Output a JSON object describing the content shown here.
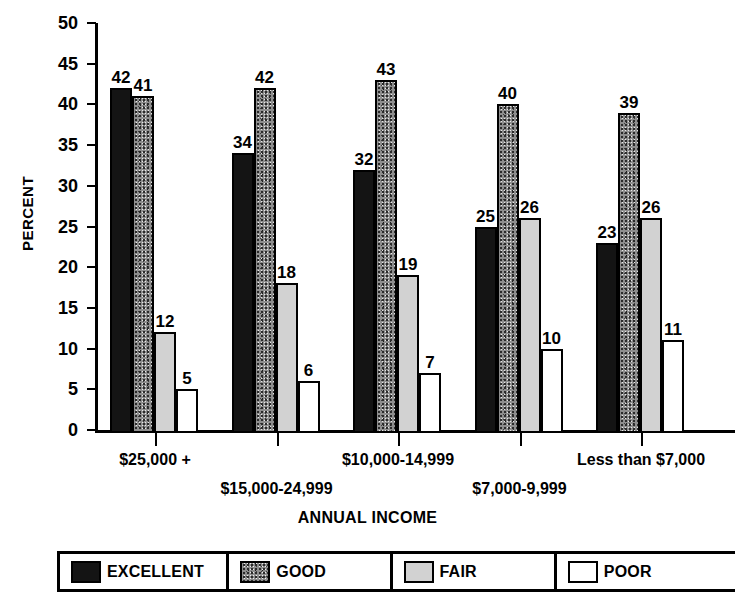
{
  "chart_data": {
    "type": "bar",
    "title": "",
    "xlabel": "ANNUAL INCOME",
    "ylabel": "PERCENT",
    "ylim": [
      0,
      50
    ],
    "ytick_step": 5,
    "yticks": [
      "50",
      "45",
      "40",
      "35",
      "30",
      "25",
      "20",
      "15",
      "10",
      "5",
      "0"
    ],
    "grid": false,
    "legend_position": "bottom",
    "categories": [
      "$25,000 +",
      "$15,000-24,999",
      "$10,000-14,999",
      "$7,000-9,999",
      "Less than $7,000"
    ],
    "series": [
      {
        "name": "EXCELLENT",
        "color": "#141414",
        "values": [
          42,
          34,
          32,
          25,
          23
        ]
      },
      {
        "name": "GOOD",
        "color": "#8e8e8e",
        "values": [
          41,
          42,
          43,
          40,
          39
        ]
      },
      {
        "name": "FAIR",
        "color": "#d2d2d2",
        "values": [
          12,
          18,
          19,
          26,
          26
        ]
      },
      {
        "name": "POOR",
        "color": "#ffffff",
        "values": [
          5,
          6,
          7,
          10,
          11
        ]
      }
    ]
  },
  "legend": {
    "items": [
      {
        "label": "EXCELLENT",
        "swatch": "excellent"
      },
      {
        "label": "GOOD",
        "swatch": "good"
      },
      {
        "label": "FAIR",
        "swatch": "fair"
      },
      {
        "label": "POOR",
        "swatch": "poor"
      }
    ]
  }
}
